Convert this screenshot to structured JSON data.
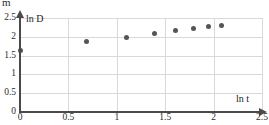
{
  "crop_fragment": "m",
  "chart_data": {
    "type": "scatter",
    "title": "",
    "xlabel": "ln t",
    "ylabel": "ln D",
    "xlim": [
      0,
      2.5
    ],
    "ylim": [
      0,
      2.5
    ],
    "grid": true,
    "legend": "none",
    "xticks": [
      "0",
      "0.5",
      "1",
      "1.5",
      "2",
      "2.5"
    ],
    "xtick_values": [
      0,
      0.5,
      1,
      1.5,
      2,
      2.5
    ],
    "yticks": [
      "0",
      "0.5",
      "1",
      "1.5",
      "2",
      "2.5"
    ],
    "ytick_values": [
      0,
      0.5,
      1,
      1.5,
      2,
      2.5
    ],
    "points": [
      {
        "x": 0.0,
        "y": 1.63
      },
      {
        "x": 0.69,
        "y": 1.87
      },
      {
        "x": 1.1,
        "y": 1.99
      },
      {
        "x": 1.39,
        "y": 2.08
      },
      {
        "x": 1.61,
        "y": 2.16
      },
      {
        "x": 1.79,
        "y": 2.23
      },
      {
        "x": 1.95,
        "y": 2.28
      },
      {
        "x": 2.08,
        "y": 2.3
      }
    ]
  },
  "colors": {
    "axis": "#4a4a4a",
    "grid": "#d9d9d9",
    "point": "#555555",
    "background": "#ffffff"
  }
}
